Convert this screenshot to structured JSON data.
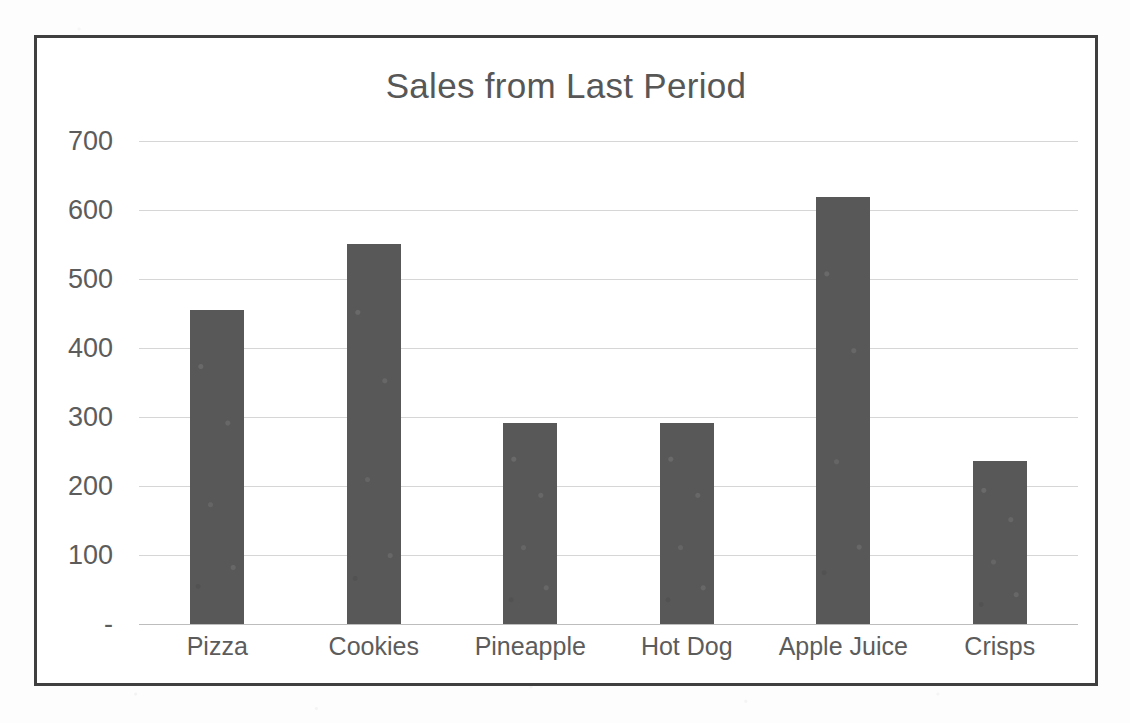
{
  "chart_data": {
    "type": "bar",
    "title": "Sales from Last Period",
    "xlabel": "",
    "ylabel": "",
    "categories": [
      "Pizza",
      "Cookies",
      "Pineapple",
      "Hot Dog",
      "Apple Juice",
      "Crisps"
    ],
    "values": [
      455,
      551,
      291,
      291,
      619,
      236
    ],
    "ylim": [
      0,
      700
    ],
    "ytick_values": [
      700,
      600,
      500,
      400,
      300,
      200,
      100,
      0
    ],
    "ytick_labels": [
      "700",
      "600",
      "500",
      "400",
      "300",
      "200",
      "100",
      "-"
    ],
    "grid": true,
    "legend": false,
    "series": [
      {
        "name": "Sales",
        "values": [
          455,
          551,
          291,
          291,
          619,
          236
        ],
        "color": "#585858"
      }
    ],
    "colors": {
      "bar": "#585858",
      "title": "#575757",
      "axis_text": "#5c5c5c",
      "gridline": "#d6d6d6",
      "frame_border": "#3f3f3f",
      "background": "#ffffff"
    }
  }
}
